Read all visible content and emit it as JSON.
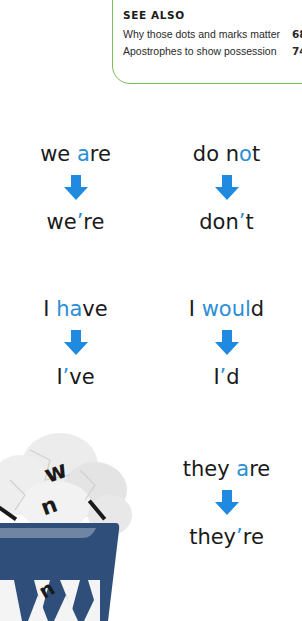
{
  "see_also": {
    "title": "SEE ALSO",
    "items": [
      {
        "label": "Why those dots and marks matter",
        "page": "68"
      },
      {
        "label": "Apostrophes to show possession",
        "page": "74"
      }
    ]
  },
  "colors": {
    "highlight": "#2b8fd6",
    "arrow": "#1f8ae0",
    "box_border": "#7cba5a",
    "basket": "#2f4f7a"
  },
  "contractions": [
    {
      "before_pre": "we ",
      "before_hl": "a",
      "before_post": "re",
      "after_pre": "we",
      "after_apos": "’",
      "after_post": "re"
    },
    {
      "before_pre": "do n",
      "before_hl": "o",
      "before_post": "t",
      "after_pre": "don",
      "after_apos": "’",
      "after_post": "t"
    },
    {
      "before_pre": "I ",
      "before_hl": "ha",
      "before_post": "ve",
      "after_pre": "I",
      "after_apos": "’",
      "after_post": "ve"
    },
    {
      "before_pre": "I ",
      "before_hl": "woul",
      "before_post": "d",
      "after_pre": "I",
      "after_apos": "’",
      "after_post": "d"
    },
    {
      "before_pre": "they ",
      "before_hl": "a",
      "before_post": "re",
      "after_pre": "they",
      "after_apos": "’",
      "after_post": "re"
    }
  ],
  "illustration": {
    "icon": "wastebasket-with-crumpled-letters-icon",
    "letters": [
      "w",
      "u",
      "l",
      "i",
      "n"
    ]
  }
}
